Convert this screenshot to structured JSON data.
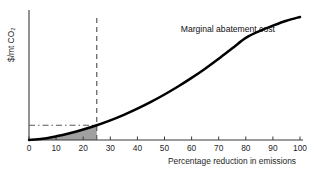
{
  "chart_data": {
    "type": "line",
    "title": "",
    "xlabel": "Percentage reduction in emissions",
    "ylabel": "$/mt CO2",
    "ylabel_display": "$/mt CO₂",
    "xlim": [
      0,
      100
    ],
    "ylim": [
      0,
      100
    ],
    "grid": false,
    "legend_position": "none",
    "xticks": [
      0,
      10,
      20,
      30,
      40,
      50,
      60,
      70,
      80,
      90,
      100
    ],
    "xtick_labels": [
      "0",
      "10",
      "20",
      "30",
      "40",
      "50",
      "60",
      "70",
      "80",
      "90",
      "100"
    ],
    "yticks": [],
    "ytick_labels": [],
    "series": [
      {
        "name": "Marginal abatement cost",
        "type": "line",
        "color": "#000000",
        "x": [
          0,
          5,
          10,
          15,
          20,
          25,
          30,
          35,
          40,
          45,
          50,
          55,
          60,
          65,
          70,
          75,
          80,
          85,
          90,
          95,
          100
        ],
        "values": [
          0,
          1.0,
          3.0,
          5.5,
          8.5,
          12.0,
          16.0,
          20.5,
          25.5,
          31.0,
          37.0,
          43.5,
          50.5,
          58.0,
          66.0,
          74.5,
          83.0,
          88.5,
          93.0,
          97.0,
          100.0
        ]
      }
    ],
    "annotations": [
      {
        "name": "curve-label",
        "text": "Marginal abatement cost",
        "x": 56,
        "y": 88
      },
      {
        "name": "abatement-level-vline",
        "type": "vline",
        "x": 25,
        "style": "dashed",
        "y_from": 0,
        "y_to": 100
      },
      {
        "name": "marginal-cost-hline",
        "type": "hline",
        "y": 12,
        "style": "dash-dot",
        "x_from": 0,
        "x_to": 25
      },
      {
        "name": "total-abatement-cost-area",
        "type": "shaded-area",
        "x_from": 0,
        "x_to": 25,
        "color": "#a0a0a0",
        "description": "area under marginal abatement cost curve"
      }
    ]
  },
  "axes": {
    "x_axis_label": "Percentage reduction in emissions",
    "y_axis_label": "$/mt CO₂"
  },
  "colors": {
    "curve": "#000000",
    "fill": "#a0a0a0",
    "axis": "#3a3a3a",
    "guide": "#5a5a5a",
    "background": "#ffffff"
  }
}
